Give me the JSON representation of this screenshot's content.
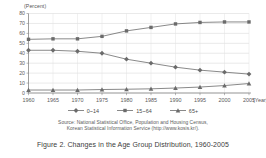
{
  "figure": {
    "caption": "Figure 2. Changes in the Age Group Distribution, 1960-2005",
    "y_unit_label": "(Percent)",
    "x_unit_label": "(Year)"
  },
  "source": {
    "line1": "Source: National Statistical Office, Population and Housing Census,",
    "line2": "Korean Statistical Information Service (http://www.kosis.kr/)."
  },
  "legend": {
    "position": "bottom-center",
    "entries": [
      {
        "label": "0~14",
        "marker": "diamond",
        "color": "#6b6b6b"
      },
      {
        "label": "15~64",
        "marker": "square",
        "color": "#6b6b6b"
      },
      {
        "label": "65+",
        "marker": "triangle",
        "color": "#6b6b6b"
      }
    ]
  },
  "axes": {
    "y_ticks": [
      "0",
      "10",
      "20",
      "30",
      "40",
      "50",
      "60",
      "70",
      "80"
    ],
    "x_ticks": [
      "1960",
      "1965",
      "1970",
      "1975",
      "1980",
      "1985",
      "1990",
      "1995",
      "2000",
      "2005"
    ]
  },
  "chart_data": {
    "type": "line",
    "title": "Figure 2. Changes in the Age Group Distribution, 1960-2005",
    "xlabel": "(Year)",
    "ylabel": "(Percent)",
    "grid": true,
    "legend_position": "bottom-center",
    "ylim": [
      0,
      80
    ],
    "ytick_step": 10,
    "categories": [
      "1960",
      "1965",
      "1970",
      "1975",
      "1980",
      "1985",
      "1990",
      "1995",
      "2000",
      "2005"
    ],
    "series": [
      {
        "name": "0~14",
        "marker": "diamond",
        "color": "#6b6b6b",
        "values": [
          43,
          43,
          42,
          40,
          34,
          30,
          26,
          23,
          21,
          19
        ]
      },
      {
        "name": "15~64",
        "marker": "square",
        "color": "#6b6b6b",
        "values": [
          54,
          54.5,
          54.5,
          57,
          62.5,
          66,
          69.5,
          71,
          71.5,
          71.5
        ]
      },
      {
        "name": "65+",
        "marker": "triangle",
        "color": "#6b6b6b",
        "values": [
          3,
          3,
          3,
          3.5,
          3.8,
          4.2,
          5,
          6,
          7.5,
          9.5
        ]
      }
    ]
  }
}
